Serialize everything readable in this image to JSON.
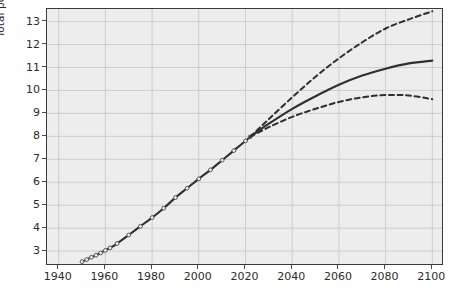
{
  "chart_data": {
    "type": "line",
    "title": "",
    "xlabel": "",
    "ylabel": "Total population (billions)",
    "xlim": [
      1935,
      2105
    ],
    "ylim": [
      2.35,
      13.55
    ],
    "xticks": [
      1940,
      1960,
      1980,
      2000,
      2020,
      2040,
      2060,
      2080,
      2100
    ],
    "yticks": [
      3,
      4,
      5,
      6,
      7,
      8,
      9,
      10,
      11,
      12,
      13
    ],
    "grid": true,
    "legend": "none",
    "background": "#ededed",
    "line_color": "#2f2f2f",
    "series": [
      {
        "name": "Historical estimates",
        "style": "solid-with-markers",
        "x": [
          1950,
          1952,
          1954,
          1956,
          1958,
          1960,
          1962,
          1965,
          1970,
          1975,
          1980,
          1985,
          1990,
          1995,
          2000,
          2005,
          2010,
          2015,
          2020,
          2022
        ],
        "values": [
          2.54,
          2.63,
          2.73,
          2.82,
          2.92,
          3.03,
          3.14,
          3.33,
          3.7,
          4.08,
          4.46,
          4.87,
          5.33,
          5.74,
          6.15,
          6.54,
          6.96,
          7.38,
          7.8,
          7.98
        ]
      },
      {
        "name": "High projection",
        "style": "dashed",
        "x": [
          2022,
          2030,
          2040,
          2050,
          2060,
          2070,
          2080,
          2090,
          2100
        ],
        "values": [
          7.98,
          8.75,
          9.7,
          10.6,
          11.4,
          12.1,
          12.7,
          13.1,
          13.45
        ]
      },
      {
        "name": "Medium projection",
        "style": "solid",
        "x": [
          2022,
          2030,
          2040,
          2050,
          2060,
          2070,
          2080,
          2090,
          2100
        ],
        "values": [
          7.98,
          8.55,
          9.2,
          9.75,
          10.25,
          10.65,
          10.95,
          11.18,
          11.3
        ]
      },
      {
        "name": "Low projection",
        "style": "dashed",
        "x": [
          2022,
          2030,
          2040,
          2050,
          2060,
          2070,
          2080,
          2090,
          2100
        ],
        "values": [
          7.98,
          8.4,
          8.85,
          9.2,
          9.5,
          9.7,
          9.8,
          9.78,
          9.62
        ]
      }
    ]
  }
}
